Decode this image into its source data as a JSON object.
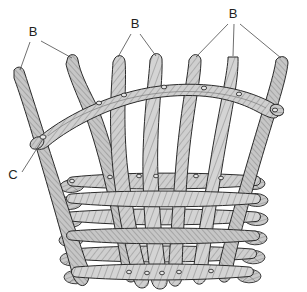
{
  "figure": {
    "background_color": "#ffffff",
    "ink_color": "#231f20",
    "rod_fill_light": "#d9d9d9",
    "rod_fill_mid": "#b0b0b0",
    "rod_fill_dark": "#8a8a8a",
    "leader_color": "#4a4a4a",
    "width": 307,
    "height": 292
  },
  "labels": [
    {
      "id": "label-b-left",
      "text": "B",
      "x": 33,
      "y": 36,
      "leaders": 2,
      "refers_to": "upright-stake"
    },
    {
      "id": "label-b-center",
      "text": "B",
      "x": 135,
      "y": 28,
      "leaders": 2,
      "refers_to": "upright-stake"
    },
    {
      "id": "label-b-right",
      "text": "B",
      "x": 233,
      "y": 18,
      "leaders": 3,
      "refers_to": "upright-stake"
    },
    {
      "id": "label-c",
      "text": "C",
      "x": 13,
      "y": 179,
      "leaders": 1,
      "refers_to": "rim-binding-joint"
    }
  ],
  "parts": {
    "upright_stakes_count": 8,
    "rim_rail_count": 1,
    "horizontal_weavers_count": 6,
    "binding_nodes_count": 22,
    "rod_end_cuts_left": 6,
    "rod_end_cuts_right": 6
  }
}
